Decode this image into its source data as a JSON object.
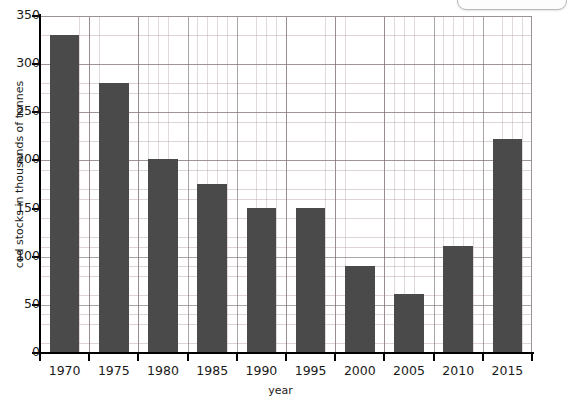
{
  "chart_data": {
    "type": "bar",
    "title": "",
    "xlabel": "year",
    "ylabel": "cod stocks in thousands of tonnes",
    "categories": [
      "1970",
      "1975",
      "1980",
      "1985",
      "1990",
      "1995",
      "2000",
      "2005",
      "2010",
      "2015"
    ],
    "values": [
      330,
      280,
      201,
      176,
      151,
      151,
      90,
      61,
      111,
      222
    ],
    "series": [
      {
        "name": "cod stocks",
        "values": [
          330,
          280,
          201,
          176,
          151,
          151,
          90,
          61,
          111,
          222
        ]
      }
    ],
    "ylim": [
      0,
      350
    ],
    "ytick_labels": [
      "0",
      "50",
      "100",
      "150",
      "200",
      "250",
      "300",
      "350"
    ],
    "ytick_values": [
      0,
      50,
      100,
      150,
      200,
      250,
      300,
      350
    ],
    "y_major_step": 50,
    "y_minor_step": 10,
    "grid": "on",
    "grid_style": "graph-paper",
    "legend": "none",
    "bar_color": "#4a4a4a",
    "axis_color": "#000000",
    "grid_major_color": "#786e70",
    "grid_minor_color": "#beaaac",
    "background_color": "#ffffff"
  },
  "axes": {
    "y_title": "cod stocks in thousands of tonnes",
    "x_title": "year"
  },
  "chrome": {
    "title_remnant": ""
  }
}
